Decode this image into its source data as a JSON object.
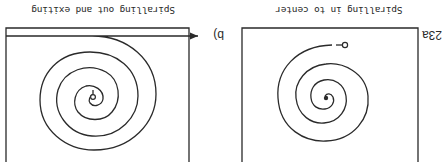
{
  "figure": {
    "number_label": "23a",
    "panels": [
      {
        "id": "a",
        "caption": "Spiralling in to center",
        "description": "Path enters at start circle near top edge and spirals inward to center point"
      },
      {
        "id": "b",
        "label": "b)",
        "caption": "Spiralling out and exiting",
        "description": "Path starts at center circle and spirals outward, exiting the frame with an arrow"
      }
    ],
    "orientation": "rotated 180 degrees",
    "colors": {
      "ink": "#2a2a2a",
      "background": "#ffffff"
    }
  }
}
